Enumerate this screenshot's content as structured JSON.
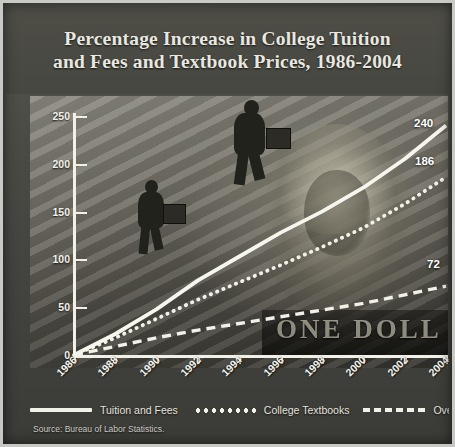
{
  "poster": {
    "title_line1": "Percentage Increase in College Tuition",
    "title_line2": "and Fees and Textbook Prices, 1986-2004",
    "source": "Source: Bureau of Labor Statistics.",
    "background_caption": "ONE DOLL"
  },
  "legend": {
    "items": [
      {
        "label": "Tuition and Fees",
        "style": "solid"
      },
      {
        "label": "College Textbooks",
        "style": "dotted"
      },
      {
        "label": "Overall Prices",
        "style": "dashed"
      }
    ]
  },
  "end_labels": {
    "tuition": "240",
    "textbooks": "186",
    "overall": "72"
  },
  "colors": {
    "line": "#f2f1e8",
    "title_text": "#e9e8e0",
    "panel": "#47473f"
  },
  "chart_data": {
    "type": "line",
    "title": "Percentage Increase in College Tuition and Fees and Textbook Prices, 1986-2004",
    "xlabel": "",
    "ylabel": "",
    "xlim": [
      1986,
      2004
    ],
    "ylim": [
      0,
      250
    ],
    "yticks": [
      0,
      50,
      100,
      150,
      200,
      250
    ],
    "xticks": [
      1986,
      1988,
      1990,
      1992,
      1994,
      1996,
      1998,
      2000,
      2002,
      2004
    ],
    "grid": false,
    "legend_position": "bottom",
    "x": [
      1986,
      1988,
      1990,
      1992,
      1994,
      1996,
      1998,
      2000,
      2002,
      2004
    ],
    "series": [
      {
        "name": "Tuition and Fees",
        "style": "solid",
        "end_value": 240,
        "values": [
          0,
          22,
          48,
          78,
          103,
          128,
          150,
          175,
          205,
          240
        ]
      },
      {
        "name": "College Textbooks",
        "style": "dotted",
        "end_value": 186,
        "values": [
          0,
          18,
          38,
          58,
          76,
          94,
          113,
          133,
          158,
          186
        ]
      },
      {
        "name": "Overall Prices",
        "style": "dashed",
        "end_value": 72,
        "values": [
          0,
          9,
          18,
          26,
          33,
          40,
          47,
          54,
          63,
          72
        ]
      }
    ]
  }
}
